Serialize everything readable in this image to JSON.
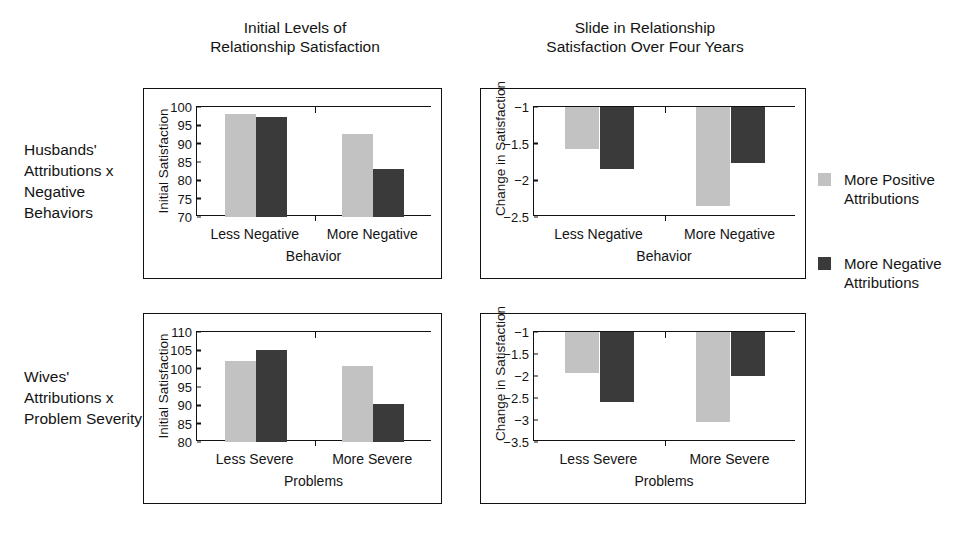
{
  "figure": {
    "column_titles": [
      "Initial Levels of\nRelationship Satisfaction",
      "Slide in Relationship\nSatisfaction Over Four Years"
    ],
    "row_labels": [
      "Husbands' Attributions x Negative Behaviors",
      "Wives' Attributions x Problem Severity"
    ]
  },
  "legend": {
    "position": "right",
    "entries": [
      {
        "label": "More Positive Attributions",
        "color": "#c2c2c2",
        "swatch": "light-gray-square"
      },
      {
        "label": "More Negative Attributions",
        "color": "#3a3a3a",
        "swatch": "dark-gray-square"
      }
    ]
  },
  "colors": {
    "more_positive": "#c2c2c2",
    "more_negative": "#3a3a3a",
    "axis": "#111111",
    "background": "#ffffff"
  },
  "chart_data": [
    {
      "id": "husbands-initial-satisfaction",
      "type": "bar",
      "title": "Initial Levels of Relationship Satisfaction",
      "row": "Husbands' Attributions x Negative Behaviors",
      "categories": [
        "Less Negative",
        "More Negative"
      ],
      "series": [
        {
          "name": "More Positive Attributions",
          "color": "#c2c2c2",
          "values": [
            98.0,
            92.6
          ]
        },
        {
          "name": "More Negative Attributions",
          "color": "#3a3a3a",
          "values": [
            97.4,
            83.0
          ]
        }
      ],
      "xlabel": "Behavior",
      "ylabel": "Initial Satisfaction",
      "ylim": [
        70,
        100
      ],
      "yticks": [
        70,
        75,
        80,
        85,
        90,
        95,
        100
      ],
      "ytick_labels": [
        "70",
        "75",
        "80",
        "85",
        "90",
        "95",
        "100"
      ],
      "grid": false,
      "baseline": 70
    },
    {
      "id": "husbands-change-satisfaction",
      "type": "bar",
      "title": "Slide in Relationship Satisfaction Over Four Years",
      "row": "Husbands' Attributions x Negative Behaviors",
      "categories": [
        "Less Negative",
        "More Negative"
      ],
      "series": [
        {
          "name": "More Positive Attributions",
          "color": "#c2c2c2",
          "values": [
            -1.57,
            -2.35
          ]
        },
        {
          "name": "More Negative Attributions",
          "color": "#3a3a3a",
          "values": [
            -1.85,
            -1.76
          ]
        }
      ],
      "xlabel": "Behavior",
      "ylabel": "Change in Satisfaction",
      "ylim": [
        -2.5,
        -1
      ],
      "yticks": [
        -1,
        -1.5,
        -2,
        -2.5
      ],
      "ytick_labels": [
        "−1",
        "−1.5",
        "−2",
        "−2.5"
      ],
      "grid": false,
      "baseline": -1
    },
    {
      "id": "wives-initial-satisfaction",
      "type": "bar",
      "title": "Initial Levels of Relationship Satisfaction",
      "row": "Wives' Attributions x Problem Severity",
      "categories": [
        "Less Severe",
        "More Severe"
      ],
      "series": [
        {
          "name": "More Positive Attributions",
          "color": "#c2c2c2",
          "values": [
            102.0,
            100.7
          ]
        },
        {
          "name": "More Negative Attributions",
          "color": "#3a3a3a",
          "values": [
            105.2,
            90.5
          ]
        }
      ],
      "xlabel": "Problems",
      "ylabel": "Initial Satisfaction",
      "ylim": [
        80,
        110
      ],
      "yticks": [
        80,
        85,
        90,
        95,
        100,
        105,
        110
      ],
      "ytick_labels": [
        "80",
        "85",
        "90",
        "95",
        "100",
        "105",
        "110"
      ],
      "grid": false,
      "baseline": 80
    },
    {
      "id": "wives-change-satisfaction",
      "type": "bar",
      "title": "Slide in Relationship Satisfaction Over Four Years",
      "row": "Wives' Attributions x Problem Severity",
      "categories": [
        "Less Severe",
        "More Severe"
      ],
      "series": [
        {
          "name": "More Positive Attributions",
          "color": "#c2c2c2",
          "values": [
            -1.93,
            -3.05
          ]
        },
        {
          "name": "More Negative Attributions",
          "color": "#3a3a3a",
          "values": [
            -2.6,
            -2.0
          ]
        }
      ],
      "xlabel": "Problems",
      "ylabel": "Change in Satisfaction",
      "ylim": [
        -3.5,
        -1
      ],
      "yticks": [
        -1,
        -1.5,
        -2,
        -2.5,
        -3,
        -3.5
      ],
      "ytick_labels": [
        "−1",
        "−1.5",
        "−2",
        "−2.5",
        "−3",
        "−3.5"
      ],
      "grid": false,
      "baseline": -1
    }
  ]
}
